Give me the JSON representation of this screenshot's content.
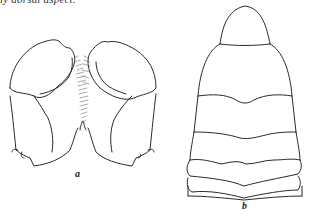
{
  "caption_fragment": "ly dorsal aspect.",
  "figure": {
    "panels": [
      {
        "label": "a",
        "description": "paired lobed structure with stippled membranous center, ventral view"
      },
      {
        "label": "b",
        "description": "segmented abdomen, dorsal view"
      }
    ],
    "line_color": "#2a2a2a",
    "background": "#ffffff"
  }
}
